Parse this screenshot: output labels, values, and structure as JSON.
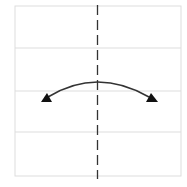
{
  "diagram": {
    "type": "origami-fold-instruction",
    "paper": {
      "x": 15,
      "y": 6,
      "width": 166,
      "height": 170,
      "border_color": "#dddddd",
      "fill": "#ffffff"
    },
    "creases": [
      {
        "orientation": "horizontal",
        "y": 48,
        "color": "#dddddd"
      },
      {
        "orientation": "horizontal",
        "y": 91,
        "color": "#dddddd"
      },
      {
        "orientation": "horizontal",
        "y": 132,
        "color": "#dddddd"
      }
    ],
    "fold_line": {
      "style": "valley-dashed",
      "x": 97.5,
      "y1": 5,
      "y2": 179,
      "color": "#333333"
    },
    "arrow": {
      "style": "double-headed-arc",
      "from": [
        44,
        99
      ],
      "control": [
        97,
        66
      ],
      "to": [
        153,
        99
      ],
      "color": "#333333",
      "head_fill": "#111111"
    }
  }
}
